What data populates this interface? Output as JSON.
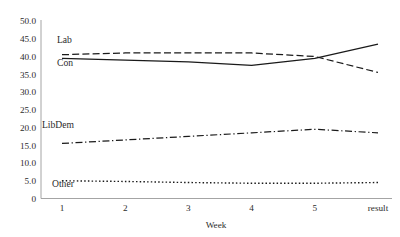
{
  "chart_data": {
    "type": "line",
    "title": "",
    "xlabel": "Week",
    "ylabel": "",
    "categories": [
      "1",
      "2",
      "3",
      "4",
      "5",
      "result"
    ],
    "ylim": [
      0,
      50
    ],
    "ytick_labels": [
      "0",
      "5.0",
      "10.0",
      "15.0",
      "20.0",
      "25.0",
      "30.0",
      "35.0",
      "40.0",
      "45.0",
      "50.0"
    ],
    "ytick_values": [
      0,
      5,
      10,
      15,
      20,
      25,
      30,
      35,
      40,
      45,
      50
    ],
    "grid": false,
    "legend_position": "inline-labels",
    "series": [
      {
        "name": "Con",
        "label": "Con",
        "style": "solid",
        "color": "#1a1a1a",
        "values": [
          39.5,
          39.0,
          38.5,
          37.5,
          39.5,
          43.5
        ]
      },
      {
        "name": "Lab",
        "label": "Lab",
        "style": "dashed",
        "color": "#1a1a1a",
        "values": [
          40.5,
          41.0,
          41.0,
          41.0,
          40.0,
          35.5
        ]
      },
      {
        "name": "LibDem",
        "label": "LibDem",
        "style": "dash-dot",
        "color": "#1a1a1a",
        "values": [
          15.5,
          16.5,
          17.5,
          18.5,
          19.5,
          18.5
        ]
      },
      {
        "name": "Other",
        "label": "Other",
        "style": "dotted",
        "color": "#1a1a1a",
        "values": [
          5.0,
          4.8,
          4.5,
          4.3,
          4.3,
          4.5
        ]
      }
    ]
  },
  "axes": {
    "x_axis_title": "Week"
  }
}
